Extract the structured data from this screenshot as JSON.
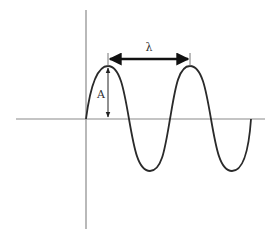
{
  "diagram": {
    "labels": {
      "wavelength": "λ",
      "amplitude": "A"
    },
    "colors": {
      "axis": "#8a8a8a",
      "wave": "#2a2a2a",
      "arrow": "#111111",
      "text": "#333333",
      "background": "#ffffff"
    },
    "axes": {
      "x_axis": {
        "x1": 16,
        "x2": 265,
        "y": 119
      },
      "y_axis": {
        "x": 86,
        "y1": 10,
        "y2": 229
      }
    },
    "wave": {
      "origin": [
        86,
        119
      ],
      "end": [
        251,
        119
      ],
      "peaks": [
        [
          108,
          66
        ],
        [
          190,
          66
        ]
      ],
      "troughs": [
        [
          150,
          171
        ],
        [
          232,
          171
        ]
      ]
    },
    "wavelength_marker": {
      "x1": 108,
      "x2": 190,
      "y": 59
    },
    "amplitude_marker": {
      "x": 108,
      "y1": 66,
      "y2": 119
    }
  }
}
